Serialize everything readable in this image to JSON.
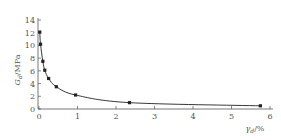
{
  "chart_data": {
    "type": "line",
    "title": "",
    "xlabel": "γd/%",
    "ylabel": "Gd/MPa",
    "xlim": [
      0,
      6
    ],
    "ylim": [
      0,
      14
    ],
    "xticks": [
      0,
      1,
      2,
      3,
      4,
      5,
      6
    ],
    "yticks": [
      0,
      2,
      4,
      6,
      8,
      10,
      12,
      14
    ],
    "grid": false,
    "legend": null,
    "series": [
      {
        "name": "Gd",
        "x": [
          0.02,
          0.04,
          0.1,
          0.15,
          0.25,
          0.45,
          0.95,
          2.35,
          5.75
        ],
        "y": [
          12.1,
          10.2,
          7.5,
          6.1,
          4.8,
          3.5,
          2.2,
          1.0,
          0.5
        ],
        "marker": "square",
        "color": "#222222"
      }
    ]
  },
  "labels": {
    "ylabel_main": "G",
    "ylabel_sub": "d",
    "ylabel_unit": "/MPa",
    "xlabel_main": "γ",
    "xlabel_sub": "d",
    "xlabel_unit": "/%"
  }
}
